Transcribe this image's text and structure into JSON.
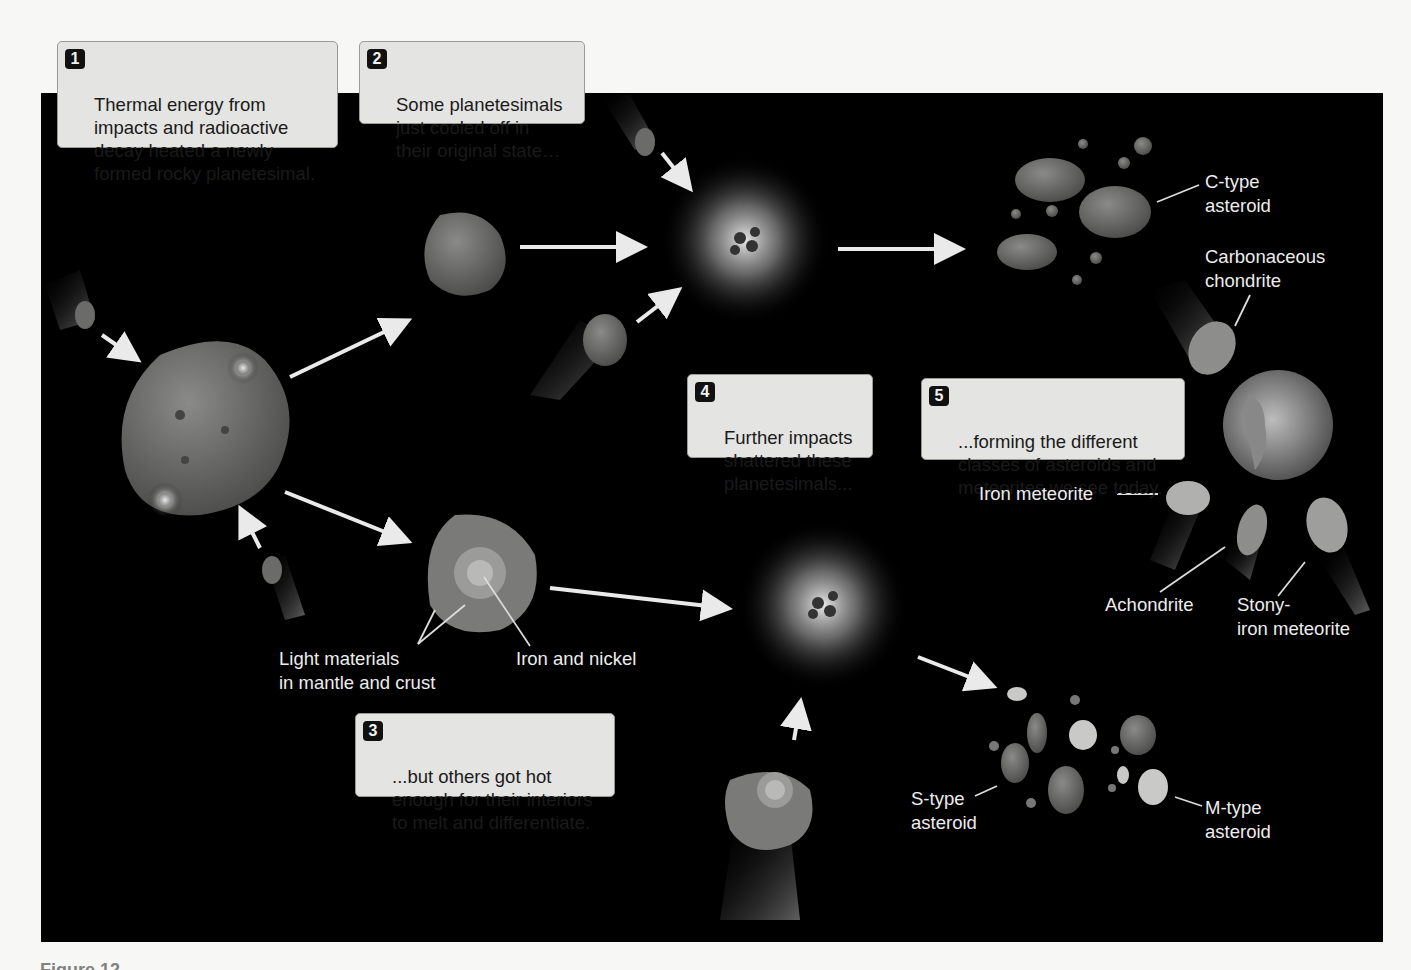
{
  "figure": {
    "background_panel_color": "#000000",
    "callouts": [
      {
        "number": "1",
        "text": "Thermal energy from\nimpacts and radioactive\ndecay heated a newly\nformed rocky planetesimal."
      },
      {
        "number": "2",
        "text": "Some planetesimals\njust cooled off in\ntheir original state…"
      },
      {
        "number": "3",
        "text": "...but others got hot\nenough for their interiors\nto melt and differentiate."
      },
      {
        "number": "4",
        "text": "Further impacts\nshattered these\nplanetesimals..."
      },
      {
        "number": "5",
        "text": "...forming the different\nclasses of asteroids and\nmeteorites we see today."
      }
    ],
    "labels": {
      "c_type": "C-type\nasteroid",
      "carbonaceous": "Carbonaceous\nchondrite",
      "iron_meteorite": "Iron meteorite",
      "achondrite": "Achondrite",
      "stony_iron": "Stony-\niron meteorite",
      "light_materials": "Light materials\nin mantle and crust",
      "iron_nickel": "Iron and nickel",
      "s_type": "S-type\nasteroid",
      "m_type": "M-type\nasteroid"
    },
    "caption_partial": "Figure 12"
  }
}
